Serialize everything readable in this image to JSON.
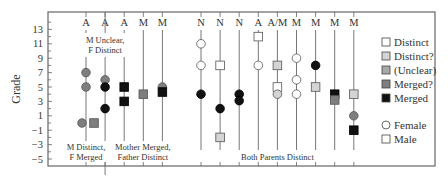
{
  "chart_data": {
    "type": "scatter",
    "title": "",
    "xlabel": "",
    "ylabel": "Grade",
    "ylim": [
      -5.5,
      14.5
    ],
    "yticks": [
      13,
      11,
      9,
      7,
      5,
      3,
      1,
      -1,
      -3,
      -5
    ],
    "grid": false,
    "legend_position": "right",
    "columns": [
      {
        "label": "A",
        "points": [
          {
            "y": 7,
            "shape": "circle",
            "status": "Merged?"
          },
          {
            "y": 5,
            "shape": "circle",
            "status": "Merged?"
          },
          {
            "y": 0,
            "shape": "circle",
            "status": "Merged?"
          },
          {
            "y": 0,
            "shape": "square",
            "status": "Merged?",
            "offset": 1
          }
        ]
      },
      {
        "label": "A",
        "points": [
          {
            "y": 6,
            "shape": "circle",
            "status": "Merged?"
          },
          {
            "y": 5,
            "shape": "circle",
            "status": "Merged"
          },
          {
            "y": 2,
            "shape": "circle",
            "status": "Merged"
          }
        ]
      },
      {
        "label": "A",
        "points": [
          {
            "y": 5,
            "shape": "square",
            "status": "Merged"
          },
          {
            "y": 3,
            "shape": "square",
            "status": "Merged"
          }
        ]
      },
      {
        "label": "M",
        "points": [
          {
            "y": 4,
            "shape": "square",
            "status": "Merged?"
          }
        ]
      },
      {
        "label": "M",
        "points": [
          {
            "y": 5,
            "shape": "circle",
            "status": "Merged?"
          },
          {
            "y": 4.3,
            "shape": "square",
            "status": "Merged"
          }
        ]
      },
      {
        "label": "N",
        "points": [
          {
            "y": 11,
            "shape": "circle",
            "status": "Distinct"
          },
          {
            "y": 8,
            "shape": "circle",
            "status": "Distinct"
          },
          {
            "y": 4,
            "shape": "circle",
            "status": "Merged"
          }
        ]
      },
      {
        "label": "N",
        "points": [
          {
            "y": 8,
            "shape": "square",
            "status": "Distinct"
          },
          {
            "y": 2,
            "shape": "circle",
            "status": "Merged"
          },
          {
            "y": -2,
            "shape": "square",
            "status": "Distinct?"
          }
        ]
      },
      {
        "label": "N",
        "points": [
          {
            "y": 4,
            "shape": "circle",
            "status": "Merged"
          },
          {
            "y": 3.1,
            "shape": "circle",
            "status": "Merged"
          }
        ]
      },
      {
        "label": "A",
        "points": [
          {
            "y": 12,
            "shape": "square",
            "status": "Distinct"
          },
          {
            "y": 8,
            "shape": "circle",
            "status": "Distinct"
          }
        ]
      },
      {
        "label": "A/M",
        "points": [
          {
            "y": 8,
            "shape": "square",
            "status": "Distinct?"
          },
          {
            "y": 5,
            "shape": "square",
            "status": "Distinct"
          },
          {
            "y": 4,
            "shape": "circle",
            "status": "Distinct?"
          }
        ]
      },
      {
        "label": "M",
        "points": [
          {
            "y": 9,
            "shape": "circle",
            "status": "Distinct"
          },
          {
            "y": 6,
            "shape": "circle",
            "status": "Distinct"
          },
          {
            "y": 4,
            "shape": "circle",
            "status": "Distinct"
          }
        ]
      },
      {
        "label": "M",
        "points": [
          {
            "y": 8,
            "shape": "circle",
            "status": "Merged"
          },
          {
            "y": 5,
            "shape": "square",
            "status": "Distinct?"
          }
        ]
      },
      {
        "label": "M",
        "points": [
          {
            "y": 4,
            "shape": "square",
            "status": "Merged"
          },
          {
            "y": 3.2,
            "shape": "square",
            "status": "Merged?"
          }
        ]
      },
      {
        "label": "M",
        "points": [
          {
            "y": 4,
            "shape": "square",
            "status": "Distinct?"
          },
          {
            "y": 1,
            "shape": "circle",
            "status": "Merged?"
          },
          {
            "y": -1,
            "shape": "square",
            "status": "Merged"
          }
        ]
      }
    ],
    "group_annotations": [
      {
        "text": [
          "M Unclear,",
          "F Distinct"
        ],
        "position": "top",
        "column": 1
      },
      {
        "text": [
          "M Distinct,",
          "F Merged"
        ],
        "position": "bottom",
        "column": 0
      },
      {
        "text": [
          "Mother Merged,",
          "Father Distinct"
        ],
        "position": "bottom",
        "column": 3
      },
      {
        "text": [
          "Both Parents Distinct"
        ],
        "position": "bottom",
        "column": 9
      }
    ],
    "legend": {
      "status": [
        {
          "label": "Distinct",
          "color": "#ffffff"
        },
        {
          "label": "Distinct?",
          "color": "#d4d4d4"
        },
        {
          "label": "(Unclear)",
          "color": "#a8a8a8"
        },
        {
          "label": "Merged?",
          "color": "#7e7e7e"
        },
        {
          "label": "Merged",
          "color": "#111111"
        }
      ],
      "shape": [
        {
          "label": "Female",
          "shape": "circle"
        },
        {
          "label": "Male",
          "shape": "square"
        }
      ]
    }
  }
}
